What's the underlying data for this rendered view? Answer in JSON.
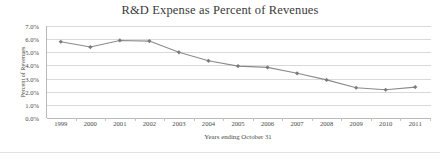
{
  "chart_data": {
    "type": "line",
    "title": "R&D Expense as Percent of Revenues",
    "xlabel": "Years ending October 31",
    "ylabel": "Percent of Revenues",
    "categories": [
      "1999",
      "2000",
      "2001",
      "2002",
      "2003",
      "2004",
      "2005",
      "2006",
      "2007",
      "2008",
      "2009",
      "2010",
      "2011"
    ],
    "values": [
      5.8,
      5.4,
      5.9,
      5.85,
      5.0,
      4.35,
      3.95,
      3.85,
      3.4,
      2.9,
      2.3,
      2.15,
      2.35
    ],
    "series": [
      {
        "name": "R&D Expense as Percent of Revenues",
        "values": [
          5.8,
          5.4,
          5.9,
          5.85,
          5.0,
          4.35,
          3.95,
          3.85,
          3.4,
          2.9,
          2.3,
          2.15,
          2.35
        ]
      }
    ],
    "ylim": [
      0.0,
      7.0
    ],
    "ytick_labels": [
      "0.0%",
      "1.0%",
      "2.0%",
      "3.0%",
      "4.0%",
      "5.0%",
      "6.0%",
      "7.0%"
    ],
    "ytick_values": [
      0.0,
      1.0,
      2.0,
      3.0,
      4.0,
      5.0,
      6.0,
      7.0
    ],
    "grid": true,
    "legend": "none",
    "marker": "diamond",
    "line_color": "#8b8b8b",
    "marker_color": "#7a7a7a",
    "grid_color": "#d9d9d9",
    "axis_color": "#b9b9b9",
    "text_color": "#4a4a4a",
    "background": "#ffffff"
  }
}
